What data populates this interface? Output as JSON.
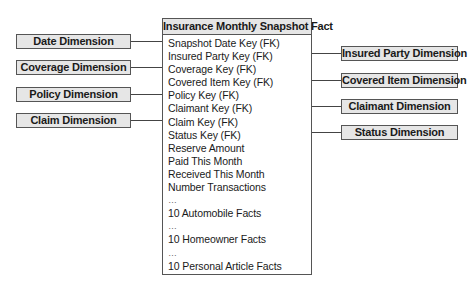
{
  "fact_table": {
    "title": "Insurance Monthly Snapshot Fact",
    "attributes": [
      "Snapshot Date Key (FK)",
      "Insured Party Key (FK)",
      "Coverage Key (FK)",
      "Covered Item Key (FK)",
      "Policy Key (FK)",
      "Claimant Key (FK)",
      "Claim Key (FK)",
      "Status Key (FK)",
      "Reserve Amount",
      "Paid This Month",
      "Received This Month",
      "Number Transactions",
      "…",
      "10 Automobile Facts",
      "…",
      "10 Homeowner Facts",
      "…",
      "10 Personal Article Facts"
    ]
  },
  "left_dimensions": [
    {
      "label": "Date Dimension"
    },
    {
      "label": "Coverage Dimension"
    },
    {
      "label": "Policy Dimension"
    },
    {
      "label": "Claim Dimension"
    }
  ],
  "right_dimensions": [
    {
      "label": "Insured Party Dimension"
    },
    {
      "label": "Covered Item Dimension"
    },
    {
      "label": "Claimant Dimension"
    },
    {
      "label": "Status Dimension"
    }
  ]
}
